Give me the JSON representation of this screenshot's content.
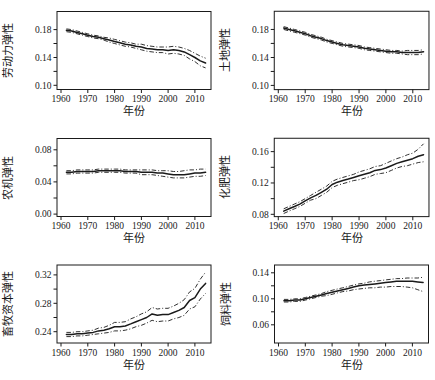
{
  "figure": {
    "background": "#ffffff",
    "line_color": "#1a1a1a",
    "xlabel": "年份",
    "layout": "2x3-grid",
    "legend": "none",
    "grid_lines": "off"
  },
  "chart_data": [
    {
      "type": "line",
      "ylabel": "劳动力弹性",
      "xlabel": "年份",
      "x": [
        1962,
        1964,
        1966,
        1968,
        1970,
        1972,
        1974,
        1976,
        1978,
        1980,
        1982,
        1984,
        1986,
        1988,
        1990,
        1992,
        1994,
        1996,
        1998,
        2000,
        2002,
        2004,
        2006,
        2008,
        2010,
        2012,
        2014
      ],
      "series": [
        {
          "name": "estimate",
          "style": "solid",
          "values": [
            0.179,
            0.178,
            0.176,
            0.174,
            0.172,
            0.17,
            0.169,
            0.167,
            0.165,
            0.163,
            0.161,
            0.159,
            0.158,
            0.156,
            0.155,
            0.153,
            0.152,
            0.151,
            0.151,
            0.15,
            0.151,
            0.15,
            0.148,
            0.144,
            0.14,
            0.135,
            0.132
          ]
        },
        {
          "name": "upper-confidence-band",
          "style": "dashdot",
          "values": [
            0.181,
            0.18,
            0.178,
            0.176,
            0.174,
            0.172,
            0.171,
            0.169,
            0.168,
            0.166,
            0.164,
            0.162,
            0.161,
            0.159,
            0.159,
            0.157,
            0.156,
            0.155,
            0.155,
            0.155,
            0.156,
            0.155,
            0.153,
            0.15,
            0.146,
            0.142,
            0.139
          ]
        },
        {
          "name": "lower-confidence-band",
          "style": "dashdot",
          "values": [
            0.177,
            0.176,
            0.174,
            0.172,
            0.17,
            0.168,
            0.167,
            0.165,
            0.162,
            0.16,
            0.158,
            0.156,
            0.155,
            0.153,
            0.151,
            0.149,
            0.148,
            0.147,
            0.147,
            0.145,
            0.146,
            0.145,
            0.143,
            0.138,
            0.134,
            0.128,
            0.125
          ]
        }
      ],
      "xticks": [
        1960,
        1970,
        1980,
        1990,
        2000,
        2010
      ],
      "yticks": [
        0.1,
        0.14,
        0.18
      ],
      "yticks_all": [
        0.1,
        0.12,
        0.14,
        0.16,
        0.18
      ],
      "xlim": [
        1958.5,
        2016
      ],
      "ylim": [
        0.094,
        0.206
      ]
    },
    {
      "type": "line",
      "ylabel": "土地弹性",
      "xlabel": "年份",
      "x": [
        1962,
        1964,
        1966,
        1968,
        1970,
        1972,
        1974,
        1976,
        1978,
        1980,
        1982,
        1984,
        1986,
        1988,
        1990,
        1992,
        1994,
        1996,
        1998,
        2000,
        2002,
        2004,
        2006,
        2008,
        2010,
        2012,
        2014
      ],
      "series": [
        {
          "name": "estimate",
          "style": "solid",
          "values": [
            0.182,
            0.18,
            0.178,
            0.176,
            0.174,
            0.171,
            0.169,
            0.167,
            0.164,
            0.162,
            0.16,
            0.158,
            0.157,
            0.156,
            0.155,
            0.153,
            0.152,
            0.151,
            0.15,
            0.149,
            0.148,
            0.148,
            0.147,
            0.147,
            0.147,
            0.147,
            0.148
          ]
        },
        {
          "name": "upper-confidence-band",
          "style": "dashdot",
          "values": [
            0.184,
            0.182,
            0.18,
            0.178,
            0.176,
            0.173,
            0.171,
            0.169,
            0.166,
            0.164,
            0.162,
            0.16,
            0.159,
            0.158,
            0.157,
            0.155,
            0.154,
            0.153,
            0.152,
            0.151,
            0.15,
            0.15,
            0.149,
            0.15,
            0.15,
            0.15,
            0.151
          ]
        },
        {
          "name": "lower-confidence-band",
          "style": "dashdot",
          "values": [
            0.18,
            0.178,
            0.176,
            0.174,
            0.172,
            0.169,
            0.167,
            0.165,
            0.162,
            0.16,
            0.158,
            0.156,
            0.155,
            0.154,
            0.153,
            0.151,
            0.15,
            0.149,
            0.148,
            0.147,
            0.146,
            0.146,
            0.145,
            0.144,
            0.144,
            0.144,
            0.145
          ]
        }
      ],
      "xticks": [
        1960,
        1970,
        1980,
        1990,
        2000,
        2010
      ],
      "yticks": [
        0.1,
        0.14,
        0.18
      ],
      "yticks_all": [
        0.1,
        0.12,
        0.14,
        0.16,
        0.18
      ],
      "xlim": [
        1958.5,
        2016
      ],
      "ylim": [
        0.094,
        0.206
      ]
    },
    {
      "type": "line",
      "ylabel": "农机弹性",
      "xlabel": "年份",
      "x": [
        1962,
        1964,
        1966,
        1968,
        1970,
        1972,
        1974,
        1976,
        1978,
        1980,
        1982,
        1984,
        1986,
        1988,
        1990,
        1992,
        1994,
        1996,
        1998,
        2000,
        2002,
        2004,
        2006,
        2008,
        2010,
        2012,
        2014
      ],
      "series": [
        {
          "name": "estimate",
          "style": "solid",
          "values": [
            0.052,
            0.052,
            0.053,
            0.053,
            0.053,
            0.053,
            0.054,
            0.054,
            0.054,
            0.054,
            0.054,
            0.053,
            0.053,
            0.053,
            0.052,
            0.052,
            0.052,
            0.051,
            0.051,
            0.05,
            0.049,
            0.049,
            0.049,
            0.05,
            0.051,
            0.051,
            0.052
          ]
        },
        {
          "name": "upper-confidence-band",
          "style": "dashdot",
          "values": [
            0.054,
            0.054,
            0.055,
            0.055,
            0.055,
            0.055,
            0.056,
            0.056,
            0.056,
            0.056,
            0.056,
            0.055,
            0.055,
            0.055,
            0.055,
            0.055,
            0.055,
            0.054,
            0.054,
            0.054,
            0.053,
            0.053,
            0.054,
            0.055,
            0.055,
            0.056,
            0.056
          ]
        },
        {
          "name": "lower-confidence-band",
          "style": "dashdot",
          "values": [
            0.05,
            0.05,
            0.051,
            0.051,
            0.051,
            0.051,
            0.052,
            0.052,
            0.052,
            0.052,
            0.052,
            0.051,
            0.051,
            0.051,
            0.049,
            0.049,
            0.049,
            0.048,
            0.047,
            0.046,
            0.045,
            0.045,
            0.045,
            0.046,
            0.047,
            0.047,
            0.048
          ]
        }
      ],
      "xticks": [
        1960,
        1970,
        1980,
        1990,
        2000,
        2010
      ],
      "yticks": [
        0.0,
        0.04,
        0.08
      ],
      "yticks_all": [
        0.0,
        0.02,
        0.04,
        0.06,
        0.08
      ],
      "xlim": [
        1958.5,
        2016
      ],
      "ylim": [
        -0.003,
        0.094
      ]
    },
    {
      "type": "line",
      "ylabel": "化肥弹性",
      "xlabel": "年份",
      "x": [
        1962,
        1964,
        1966,
        1968,
        1970,
        1972,
        1974,
        1976,
        1978,
        1980,
        1982,
        1984,
        1986,
        1988,
        1990,
        1992,
        1994,
        1996,
        1998,
        2000,
        2002,
        2004,
        2006,
        2008,
        2010,
        2012,
        2014
      ],
      "series": [
        {
          "name": "estimate",
          "style": "solid",
          "values": [
            0.084,
            0.087,
            0.09,
            0.093,
            0.097,
            0.101,
            0.104,
            0.108,
            0.112,
            0.118,
            0.121,
            0.123,
            0.125,
            0.127,
            0.129,
            0.131,
            0.133,
            0.136,
            0.137,
            0.139,
            0.142,
            0.145,
            0.147,
            0.149,
            0.151,
            0.154,
            0.156
          ]
        },
        {
          "name": "upper-confidence-band",
          "style": "dashdot",
          "values": [
            0.087,
            0.09,
            0.093,
            0.096,
            0.1,
            0.104,
            0.108,
            0.112,
            0.116,
            0.122,
            0.125,
            0.127,
            0.129,
            0.131,
            0.134,
            0.136,
            0.138,
            0.141,
            0.142,
            0.145,
            0.148,
            0.151,
            0.153,
            0.156,
            0.158,
            0.163,
            0.17
          ]
        },
        {
          "name": "lower-confidence-band",
          "style": "dashdot",
          "values": [
            0.081,
            0.084,
            0.087,
            0.09,
            0.094,
            0.098,
            0.1,
            0.104,
            0.108,
            0.114,
            0.117,
            0.119,
            0.121,
            0.123,
            0.124,
            0.126,
            0.128,
            0.131,
            0.132,
            0.133,
            0.136,
            0.139,
            0.141,
            0.142,
            0.144,
            0.146,
            0.147
          ]
        }
      ],
      "xticks": [
        1960,
        1970,
        1980,
        1990,
        2000,
        2010
      ],
      "yticks": [
        0.08,
        0.12,
        0.16
      ],
      "yticks_all": [
        0.08,
        0.1,
        0.12,
        0.14,
        0.16
      ],
      "xlim": [
        1958.5,
        2016
      ],
      "ylim": [
        0.077,
        0.177
      ]
    },
    {
      "type": "line",
      "ylabel": "畜牧资本弹性",
      "xlabel": "年份",
      "x": [
        1962,
        1964,
        1966,
        1968,
        1970,
        1972,
        1974,
        1976,
        1978,
        1980,
        1982,
        1984,
        1986,
        1988,
        1990,
        1992,
        1994,
        1996,
        1998,
        2000,
        2002,
        2004,
        2006,
        2008,
        2010,
        2012,
        2014
      ],
      "series": [
        {
          "name": "estimate",
          "style": "solid",
          "values": [
            0.236,
            0.236,
            0.237,
            0.237,
            0.238,
            0.239,
            0.241,
            0.242,
            0.244,
            0.247,
            0.247,
            0.248,
            0.251,
            0.254,
            0.257,
            0.26,
            0.265,
            0.263,
            0.264,
            0.264,
            0.267,
            0.27,
            0.274,
            0.284,
            0.288,
            0.3,
            0.308
          ]
        },
        {
          "name": "upper-confidence-band",
          "style": "dashdot",
          "values": [
            0.239,
            0.239,
            0.24,
            0.24,
            0.241,
            0.242,
            0.245,
            0.246,
            0.249,
            0.253,
            0.253,
            0.254,
            0.258,
            0.261,
            0.265,
            0.268,
            0.274,
            0.272,
            0.273,
            0.273,
            0.276,
            0.28,
            0.285,
            0.296,
            0.301,
            0.314,
            0.324
          ]
        },
        {
          "name": "lower-confidence-band",
          "style": "dashdot",
          "values": [
            0.233,
            0.233,
            0.234,
            0.234,
            0.235,
            0.236,
            0.237,
            0.238,
            0.239,
            0.241,
            0.241,
            0.242,
            0.244,
            0.247,
            0.249,
            0.252,
            0.256,
            0.254,
            0.255,
            0.255,
            0.258,
            0.26,
            0.263,
            0.272,
            0.275,
            0.286,
            0.294
          ]
        }
      ],
      "xticks": [
        1960,
        1970,
        1980,
        1990,
        2000,
        2010
      ],
      "yticks": [
        0.24,
        0.28,
        0.32
      ],
      "yticks_all": [
        0.24,
        0.26,
        0.28,
        0.3,
        0.32
      ],
      "xlim": [
        1958.5,
        2016
      ],
      "ylim": [
        0.224,
        0.334
      ]
    },
    {
      "type": "line",
      "ylabel": "饲料弹性",
      "xlabel": "年份",
      "x": [
        1962,
        1964,
        1966,
        1968,
        1970,
        1972,
        1974,
        1976,
        1978,
        1980,
        1982,
        1984,
        1986,
        1988,
        1990,
        1992,
        1994,
        1996,
        1998,
        2000,
        2002,
        2004,
        2006,
        2008,
        2010,
        2012,
        2014
      ],
      "series": [
        {
          "name": "estimate",
          "style": "solid",
          "values": [
            0.097,
            0.097,
            0.098,
            0.098,
            0.1,
            0.102,
            0.104,
            0.106,
            0.108,
            0.11,
            0.112,
            0.114,
            0.116,
            0.118,
            0.12,
            0.121,
            0.122,
            0.123,
            0.124,
            0.125,
            0.126,
            0.127,
            0.127,
            0.127,
            0.127,
            0.126,
            0.125
          ]
        },
        {
          "name": "upper-confidence-band",
          "style": "dashdot",
          "values": [
            0.099,
            0.099,
            0.1,
            0.1,
            0.102,
            0.104,
            0.106,
            0.108,
            0.111,
            0.113,
            0.115,
            0.117,
            0.119,
            0.121,
            0.123,
            0.124,
            0.126,
            0.127,
            0.128,
            0.129,
            0.13,
            0.131,
            0.131,
            0.132,
            0.132,
            0.132,
            0.133
          ]
        },
        {
          "name": "lower-confidence-band",
          "style": "dashdot",
          "values": [
            0.095,
            0.095,
            0.096,
            0.096,
            0.098,
            0.1,
            0.102,
            0.104,
            0.105,
            0.107,
            0.109,
            0.111,
            0.112,
            0.114,
            0.115,
            0.116,
            0.117,
            0.117,
            0.118,
            0.118,
            0.119,
            0.119,
            0.119,
            0.118,
            0.117,
            0.114,
            0.111
          ]
        }
      ],
      "xticks": [
        1960,
        1970,
        1980,
        1990,
        2000,
        2010
      ],
      "yticks": [
        0.06,
        0.1,
        0.14
      ],
      "yticks_all": [
        0.06,
        0.08,
        0.1,
        0.12,
        0.14
      ],
      "xlim": [
        1958.5,
        2016
      ],
      "ylim": [
        0.032,
        0.152
      ]
    }
  ]
}
